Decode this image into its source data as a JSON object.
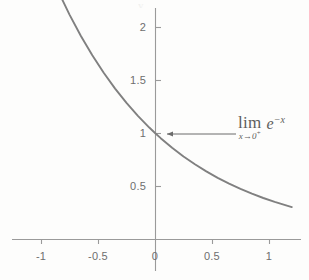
{
  "chart_data": {
    "type": "line",
    "title": "",
    "xlabel": "",
    "ylabel": "",
    "function": "y = e^{-x}",
    "xlim": [
      -1.3,
      1.27
    ],
    "ylim": [
      -0.22,
      2.32
    ],
    "grid": false,
    "legend": false,
    "axis_color": "#9a9a9a",
    "curve_color": "#808080",
    "annotation_color": "#5d5d5d",
    "background_color": "#fdfdfc",
    "x_ticks": [
      {
        "value": -1,
        "label": "-1",
        "px": 41
      },
      {
        "value": -0.5,
        "label": "-0.5",
        "px": 98
      },
      {
        "value": 0,
        "label": "0",
        "px": 155
      },
      {
        "value": 0.5,
        "label": "0.5",
        "px": 212
      },
      {
        "value": 1,
        "label": "1",
        "px": 269
      }
    ],
    "y_ticks": [
      {
        "value": 0.5,
        "label": "0.5",
        "px": 186
      },
      {
        "value": 1,
        "label": "1",
        "px": 133
      },
      {
        "value": 1.5,
        "label": "1.5",
        "px": 80
      },
      {
        "value": 2,
        "label": "2",
        "px": 27
      }
    ],
    "series": [
      {
        "name": "e^{-x}",
        "x": [
          -1.25,
          -1.15,
          -1.05,
          -0.95,
          -0.85,
          -0.75,
          -0.65,
          -0.55,
          -0.45,
          -0.35,
          -0.25,
          -0.15,
          -0.05,
          0.0,
          0.05,
          0.15,
          0.25,
          0.35,
          0.45,
          0.55,
          0.65,
          0.75,
          0.85,
          0.95,
          1.05,
          1.15,
          1.2
        ],
        "y": [
          3.4903,
          3.1582,
          2.8577,
          2.5857,
          2.3396,
          2.117,
          1.9155,
          1.7333,
          1.5683,
          1.4191,
          1.284,
          1.1618,
          1.0513,
          1.0,
          0.9512,
          0.8607,
          0.7788,
          0.7047,
          0.6376,
          0.5769,
          0.522,
          0.4724,
          0.4274,
          0.3867,
          0.3499,
          0.3166,
          0.3012
        ]
      }
    ],
    "annotations": [
      {
        "name": "limit-annotation",
        "text": "lim",
        "subscript": "x→0",
        "subscript_sign": "+",
        "expression": "e",
        "exponent": "−x",
        "full_text": "lim_{x→0^+} e^{-x}",
        "points_to": {
          "x": 0.05,
          "y": 0.95
        },
        "arrow": {
          "from_px": [
            236,
            134
          ],
          "to_px": [
            165,
            134
          ],
          "head": "left"
        }
      }
    ]
  },
  "figure": {
    "top_artifact": "y"
  }
}
